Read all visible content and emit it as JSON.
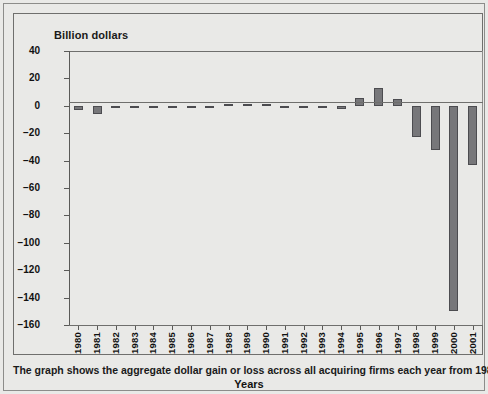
{
  "chart_data": {
    "type": "bar",
    "title": "",
    "ylabel": "Billion dollars",
    "xlabel": "Years",
    "ylim": [
      -160,
      40
    ],
    "yticks": [
      40,
      20,
      0,
      -20,
      -40,
      -60,
      -80,
      -100,
      -120,
      -140,
      -160
    ],
    "ytick_labels": [
      "40",
      "20",
      "0",
      "−20",
      "−40",
      "−60",
      "−80",
      "−100",
      "−120",
      "−140",
      "−160"
    ],
    "grid": false,
    "legend": null,
    "bar_color": "#77777a",
    "bar_edge_color": "#4c4c50",
    "categories": [
      "1980",
      "1981",
      "1982",
      "1983",
      "1984",
      "1985",
      "1986",
      "1987",
      "1988",
      "1989",
      "1990",
      "1991",
      "1992",
      "1993",
      "1994",
      "1995",
      "1996",
      "1997",
      "1998",
      "1999",
      "2000",
      "2001"
    ],
    "values": [
      -3,
      -6,
      -1,
      -1,
      -1,
      -1,
      -1,
      -1,
      1,
      1,
      1,
      0,
      -1,
      -1,
      -2,
      6,
      13,
      5,
      -23,
      -32,
      -150,
      -43
    ]
  },
  "caption": {
    "text": "The graph shows the aggregate dollar gain or loss across all acquiring firms each year from 1980 to 2001."
  }
}
